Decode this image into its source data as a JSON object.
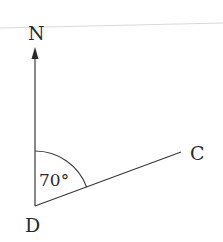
{
  "diagram": {
    "type": "bearing",
    "points": {
      "north_label": "N",
      "vertex_label": "D",
      "end_label": "C"
    },
    "angle": {
      "label": "70°",
      "value_degrees": 70,
      "from": "N",
      "to": "C"
    },
    "colors": {
      "stroke": "#3a3a3a",
      "text": "#2a2a2a",
      "rule": "#d6d6d6"
    }
  }
}
